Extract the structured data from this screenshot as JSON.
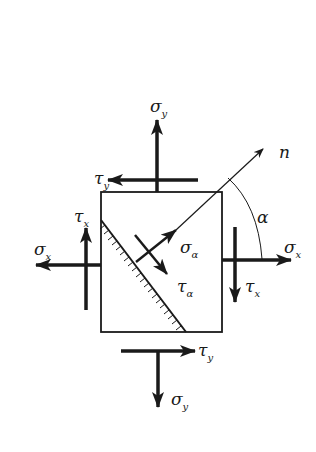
{
  "diagram": {
    "title": "",
    "type": "plane stress element with inclined section",
    "colors": {
      "stroke": "#1a1a1a",
      "background": "#ffffff"
    },
    "labels": {
      "sigma_y_top": {
        "symbol": "σ",
        "subscript": "y"
      },
      "tau_y_top": {
        "symbol": "τ",
        "subscript": "y"
      },
      "tau_x_left": {
        "symbol": "τ",
        "subscript": "x"
      },
      "sigma_x_left": {
        "symbol": "σ",
        "subscript": "x"
      },
      "sigma_x_right": {
        "symbol": "σ",
        "subscript": "x"
      },
      "tau_x_right": {
        "symbol": "τ",
        "subscript": "x"
      },
      "sigma_alpha": {
        "symbol": "σ",
        "subscript": "α"
      },
      "tau_alpha": {
        "symbol": "τ",
        "subscript": "α"
      },
      "tau_y_bottom": {
        "symbol": "τ",
        "subscript": "y"
      },
      "sigma_y_bottom": {
        "symbol": "σ",
        "subscript": "y"
      },
      "normal": {
        "symbol": "n"
      },
      "angle": {
        "symbol": "α"
      }
    }
  }
}
